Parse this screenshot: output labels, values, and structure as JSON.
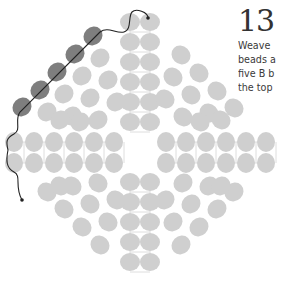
{
  "step": {
    "number": "13",
    "text_lines": [
      "Weave",
      "beads a",
      "five B b",
      "the top"
    ]
  },
  "colors": {
    "bead_light": "#cfcfcf",
    "bead_dark": "#7e7e7e",
    "thread_light": "#dedede",
    "thread_path": "#222222",
    "text": "#333333"
  },
  "diagram": {
    "bead_size": {
      "rx": 9,
      "ry": 10
    },
    "center_column": {
      "x": [
        130,
        150
      ],
      "y": [
        22,
        42,
        62,
        82,
        102,
        122,
        182,
        202,
        222,
        242,
        262
      ]
    },
    "middle_rows": {
      "y": [
        142,
        163
      ],
      "x_left": [
        14,
        34,
        54,
        74,
        94,
        114
      ],
      "x_right": [
        166,
        186,
        206,
        226,
        246,
        266
      ]
    },
    "dark_beads": [
      [
        93,
        36
      ],
      [
        75,
        54
      ],
      [
        57,
        72
      ],
      [
        40,
        90
      ],
      [
        22,
        107
      ]
    ],
    "quadrant_beads": {
      "upper_left": [
        [
          100,
          58
        ],
        [
          82,
          76
        ],
        [
          64,
          94
        ],
        [
          47,
          112
        ],
        [
          108,
          80
        ],
        [
          90,
          98
        ],
        [
          72,
          116
        ],
        [
          116,
          102
        ],
        [
          98,
          120
        ],
        [
          60,
          120
        ],
        [
          80,
          122
        ]
      ],
      "upper_right": [
        [
          181,
          55
        ],
        [
          199,
          73
        ],
        [
          217,
          91
        ],
        [
          234,
          108
        ],
        [
          173,
          77
        ],
        [
          191,
          95
        ],
        [
          209,
          113
        ],
        [
          165,
          99
        ],
        [
          183,
          117
        ],
        [
          221,
          120
        ],
        [
          200,
          122
        ]
      ],
      "lower_left": [
        [
          47,
          192
        ],
        [
          64,
          209
        ],
        [
          82,
          227
        ],
        [
          100,
          245
        ],
        [
          72,
          186
        ],
        [
          90,
          204
        ],
        [
          108,
          222
        ],
        [
          98,
          183
        ],
        [
          116,
          200
        ],
        [
          60,
          186
        ]
      ],
      "lower_right": [
        [
          234,
          192
        ],
        [
          217,
          209
        ],
        [
          199,
          227
        ],
        [
          181,
          245
        ],
        [
          209,
          186
        ],
        [
          191,
          204
        ],
        [
          173,
          222
        ],
        [
          183,
          183
        ],
        [
          165,
          200
        ],
        [
          221,
          186
        ]
      ]
    },
    "thread_path": "M148,18 C148,12 136,8 132,12 C128,16 132,30 124,32 C116,34 108,26 100,32 L20,112 C14,120 22,130 14,134 C6,138 6,142 8,150 C6,160 6,168 14,172 C22,176 14,186 22,200",
    "thread_end_dots": [
      [
        148,
        18
      ],
      [
        22,
        200
      ]
    ]
  }
}
